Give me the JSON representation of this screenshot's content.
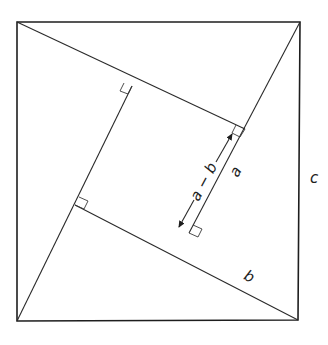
{
  "diagram": {
    "type": "geometric-proof",
    "labels": {
      "hypotenuse": "c",
      "long_leg": "a",
      "short_leg": "b",
      "inner_side": "a − b"
    },
    "colors": {
      "stroke": "#1e1e1e",
      "background": "#ffffff"
    },
    "outer_square": [
      [
        17,
        22
      ],
      [
        300,
        22
      ],
      [
        298,
        320
      ],
      [
        17,
        321
      ]
    ],
    "inner_square": [
      [
        132,
        86
      ],
      [
        245,
        129
      ],
      [
        189,
        233
      ],
      [
        75,
        205
      ]
    ]
  }
}
